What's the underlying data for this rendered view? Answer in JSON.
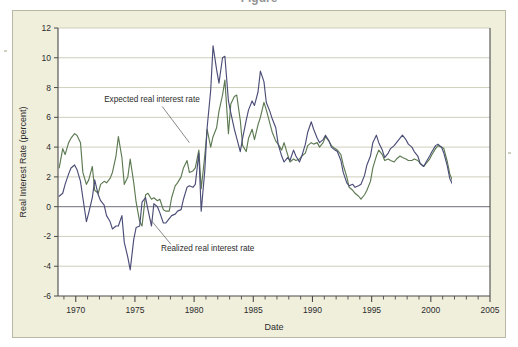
{
  "figure": {
    "cropped_title": "Figure",
    "panel_color": "#f0efdc",
    "plot_bg": "#ffffff"
  },
  "chart_data": {
    "type": "line",
    "title": "",
    "xlabel": "Date",
    "ylabel": "Real Interest Rate (percent)",
    "xlim": [
      1968.5,
      2005.0
    ],
    "ylim": [
      -6,
      12
    ],
    "yticks": [
      -6,
      -4,
      -2,
      0,
      2,
      4,
      6,
      8,
      10,
      12
    ],
    "ytick_labels": [
      "-6",
      "-4",
      "-2",
      "0",
      "2",
      "4",
      "6",
      "8",
      "10",
      "12"
    ],
    "xticks": [
      1970,
      1975,
      1980,
      1985,
      1990,
      1995,
      2000,
      2005
    ],
    "xtick_labels": [
      "1970",
      "1975",
      "1980",
      "1985",
      "1990",
      "1995",
      "2000",
      "2005"
    ],
    "xminor_step": 1,
    "grid": "horizontal",
    "zero_line": 0,
    "legend": "annotations",
    "annotations": [
      {
        "text": "Expected real interest rate",
        "series": "expected",
        "label_x": 1972.4,
        "label_y": 7.0,
        "point_x": 1979.6,
        "point_y": 4.3
      },
      {
        "text": "Realized real interest rate",
        "series": "realized",
        "label_x": 1977.2,
        "label_y": -3.0,
        "point_x": 1976.3,
        "point_y": -0.85
      }
    ],
    "series": [
      {
        "name": "Expected real interest rate",
        "color": "#5d7a52",
        "x": [
          1968.6,
          1968.9,
          1969.1,
          1969.4,
          1969.6,
          1969.9,
          1970.1,
          1970.4,
          1970.6,
          1970.9,
          1971.1,
          1971.4,
          1971.6,
          1971.9,
          1972.1,
          1972.4,
          1972.6,
          1972.9,
          1973.1,
          1973.4,
          1973.6,
          1973.9,
          1974.1,
          1974.4,
          1974.6,
          1974.9,
          1975.1,
          1975.4,
          1975.6,
          1975.9,
          1976.1,
          1976.4,
          1976.6,
          1976.9,
          1977.1,
          1977.4,
          1977.6,
          1977.9,
          1978.1,
          1978.4,
          1978.6,
          1978.9,
          1979.1,
          1979.4,
          1979.6,
          1979.9,
          1980.1,
          1980.4,
          1980.6,
          1980.9,
          1981.1,
          1981.4,
          1981.6,
          1981.9,
          1982.1,
          1982.4,
          1982.6,
          1982.9,
          1983.1,
          1983.4,
          1983.6,
          1983.9,
          1984.1,
          1984.4,
          1984.6,
          1984.9,
          1985.1,
          1985.4,
          1985.6,
          1985.9,
          1986.1,
          1986.4,
          1986.6,
          1986.9,
          1987.1,
          1987.4,
          1987.6,
          1987.9,
          1988.1,
          1988.4,
          1988.6,
          1988.9,
          1989.1,
          1989.4,
          1989.6,
          1989.9,
          1990.1,
          1990.4,
          1990.6,
          1990.9,
          1991.1,
          1991.4,
          1991.6,
          1991.9,
          1992.1,
          1992.4,
          1992.6,
          1992.9,
          1993.1,
          1993.4,
          1993.6,
          1993.9,
          1994.1,
          1994.4,
          1994.6,
          1994.9,
          1995.1,
          1995.4,
          1995.6,
          1995.9,
          1996.1,
          1996.4,
          1996.6,
          1996.9,
          1997.1,
          1997.4,
          1997.6,
          1997.9,
          1998.1,
          1998.4,
          1998.6,
          1998.9,
          1999.1,
          1999.4,
          1999.6,
          1999.9,
          2000.1,
          2000.4,
          2000.6,
          2000.9,
          2001.1,
          2001.4,
          2001.6,
          2001.9,
          2002.1,
          2002.4,
          2002.6,
          2002.9,
          2003.1,
          2003.4,
          2003.6,
          2003.9,
          2004.1,
          2004.4,
          2004.6,
          2004.9
        ],
        "y": [
          2.6,
          3.9,
          3.5,
          4.3,
          4.6,
          4.9,
          4.8,
          4.3,
          2.3,
          1.5,
          1.8,
          2.7,
          1.1,
          0.9,
          1.5,
          1.7,
          1.6,
          1.9,
          2.3,
          3.4,
          4.7,
          3.3,
          1.5,
          2.0,
          3.2,
          1.6,
          0.3,
          -1.0,
          -1.3,
          0.8,
          0.9,
          0.5,
          0.6,
          0.4,
          0.5,
          -0.2,
          -0.3,
          -0.3,
          0.6,
          1.4,
          1.6,
          2.0,
          2.6,
          3.1,
          2.3,
          2.4,
          2.6,
          3.8,
          1.2,
          3.4,
          5.2,
          4.0,
          4.7,
          5.3,
          6.4,
          7.5,
          8.5,
          4.9,
          6.9,
          7.4,
          7.5,
          5.8,
          4.1,
          3.7,
          4.6,
          5.2,
          4.5,
          5.5,
          6.0,
          7.0,
          6.5,
          5.6,
          5.0,
          4.4,
          4.2,
          3.8,
          4.3,
          3.5,
          3.0,
          3.2,
          3.1,
          3.2,
          3.4,
          3.6,
          4.1,
          4.3,
          4.2,
          4.3,
          4.0,
          4.3,
          4.7,
          4.4,
          4.1,
          3.9,
          3.8,
          3.5,
          2.8,
          2.0,
          1.3,
          1.1,
          0.9,
          0.7,
          0.5,
          0.8,
          1.1,
          1.7,
          2.6,
          3.4,
          3.8,
          3.5,
          3.1,
          3.2,
          3.1,
          3.0,
          3.2,
          3.4,
          3.3,
          3.2,
          3.1,
          3.1,
          3.2,
          3.1,
          2.9,
          2.7,
          2.9,
          3.2,
          3.5,
          3.9,
          4.1,
          4.0,
          3.9,
          3.0,
          2.2,
          1.6,
          1.2,
          0.8,
          0.5,
          0.1,
          -0.3,
          -0.5,
          -0.6,
          -0.5,
          -0.2,
          0.1,
          0.5,
          1.0
        ]
      },
      {
        "name": "Realized real interest rate",
        "color": "#4b4d77",
        "x": [
          1968.6,
          1968.9,
          1969.1,
          1969.4,
          1969.6,
          1969.9,
          1970.1,
          1970.4,
          1970.6,
          1970.9,
          1971.1,
          1971.4,
          1971.6,
          1971.9,
          1972.1,
          1972.4,
          1972.6,
          1972.9,
          1973.1,
          1973.4,
          1973.6,
          1973.9,
          1974.1,
          1974.4,
          1974.6,
          1974.9,
          1975.1,
          1975.4,
          1975.6,
          1975.9,
          1976.1,
          1976.4,
          1976.6,
          1976.9,
          1977.1,
          1977.4,
          1977.6,
          1977.9,
          1978.1,
          1978.4,
          1978.6,
          1978.9,
          1979.1,
          1979.4,
          1979.6,
          1979.9,
          1980.1,
          1980.4,
          1980.6,
          1980.9,
          1981.1,
          1981.4,
          1981.6,
          1981.9,
          1982.1,
          1982.4,
          1982.6,
          1982.9,
          1983.1,
          1983.4,
          1983.6,
          1983.9,
          1984.1,
          1984.4,
          1984.6,
          1984.9,
          1985.1,
          1985.4,
          1985.6,
          1985.9,
          1986.1,
          1986.4,
          1986.6,
          1986.9,
          1987.1,
          1987.4,
          1987.6,
          1987.9,
          1988.1,
          1988.4,
          1988.6,
          1988.9,
          1989.1,
          1989.4,
          1989.6,
          1989.9,
          1990.1,
          1990.4,
          1990.6,
          1990.9,
          1991.1,
          1991.4,
          1991.6,
          1991.9,
          1992.1,
          1992.4,
          1992.6,
          1992.9,
          1993.1,
          1993.4,
          1993.6,
          1993.9,
          1994.1,
          1994.4,
          1994.6,
          1994.9,
          1995.1,
          1995.4,
          1995.6,
          1995.9,
          1996.1,
          1996.4,
          1996.6,
          1996.9,
          1997.1,
          1997.4,
          1997.6,
          1997.9,
          1998.1,
          1998.4,
          1998.6,
          1998.9,
          1999.1,
          1999.4,
          1999.6,
          1999.9,
          2000.1,
          2000.4,
          2000.6,
          2000.9,
          2001.1,
          2001.4,
          2001.6,
          2001.9,
          2002.1,
          2002.4,
          2002.6,
          2002.9,
          2003.1,
          2003.4,
          2003.6,
          2003.9,
          2004.1,
          2004.4
        ],
        "y": [
          0.7,
          0.9,
          1.5,
          2.2,
          2.6,
          2.8,
          2.5,
          1.7,
          0.6,
          -1.0,
          -0.4,
          0.6,
          1.8,
          0.8,
          0.4,
          0.1,
          -0.6,
          -1.0,
          -1.5,
          -1.3,
          -1.3,
          -0.6,
          -2.4,
          -3.4,
          -4.25,
          -2.2,
          -1.4,
          -1.3,
          0.3,
          0.6,
          -0.2,
          -1.3,
          0.2,
          0.0,
          -0.4,
          -1.1,
          -1.1,
          -0.8,
          -0.6,
          -0.5,
          -0.3,
          -0.2,
          0.5,
          1.3,
          1.4,
          1.3,
          1.5,
          3.6,
          -0.3,
          2.4,
          5.3,
          7.8,
          10.8,
          9.2,
          8.3,
          10.0,
          10.1,
          7.1,
          6.3,
          5.2,
          4.6,
          3.7,
          4.6,
          5.8,
          6.5,
          7.1,
          6.8,
          7.7,
          9.1,
          8.4,
          7.0,
          6.4,
          5.9,
          5.3,
          4.2,
          3.4,
          3.0,
          3.3,
          3.1,
          3.8,
          3.4,
          3.0,
          3.4,
          4.2,
          5.0,
          5.7,
          5.2,
          4.6,
          4.3,
          4.5,
          4.8,
          4.4,
          4.0,
          3.8,
          3.7,
          3.1,
          2.3,
          1.6,
          1.4,
          1.5,
          1.3,
          1.4,
          1.5,
          2.1,
          2.8,
          3.4,
          4.3,
          4.8,
          4.3,
          3.8,
          3.3,
          3.6,
          3.9,
          4.1,
          4.3,
          4.6,
          4.8,
          4.5,
          4.2,
          4.0,
          3.7,
          3.4,
          2.9,
          2.7,
          3.0,
          3.4,
          3.7,
          4.1,
          4.2,
          4.0,
          3.6,
          2.7,
          1.9,
          1.4,
          1.0,
          0.6,
          0.5,
          0.6,
          0.1,
          -0.4,
          -0.8,
          -1.2,
          -1.25,
          -1.1
        ]
      }
    ]
  }
}
